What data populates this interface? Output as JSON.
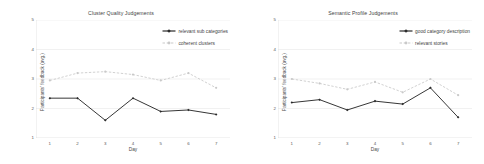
{
  "figure": {
    "background": "#ffffff",
    "solid_color": "#2b2b2b",
    "dashed_color": "#c9c9c9",
    "axis_color": "#d9d9d9",
    "grid_color": "#e8e8e8",
    "text_color": "#3f3f3f"
  },
  "panels": [
    {
      "id": "left",
      "chart_data": {
        "type": "line",
        "title": "Cluster Quality Judgements",
        "xlabel": "Day",
        "ylabel": "Participants' feedback (avg.)",
        "x": [
          1,
          2,
          3,
          4,
          5,
          6,
          7
        ],
        "xticklabels": [
          "1",
          "2",
          "3",
          "4",
          "5",
          "6",
          "7"
        ],
        "yticks": [
          1,
          2,
          3,
          4,
          5
        ],
        "yticklabels": [
          "1",
          "2",
          "3",
          "4",
          "5"
        ],
        "ylim": [
          1,
          5
        ],
        "xlim": [
          0.5,
          7.5
        ],
        "grid": "horizontal",
        "legend_position": "upper-right-inside",
        "series": [
          {
            "name": "relevant sub categories",
            "style": "solid",
            "marker": "diamond",
            "color": "#2b2b2b",
            "values": [
              2.35,
              2.35,
              1.6,
              2.35,
              1.9,
              1.95,
              1.8
            ]
          },
          {
            "name": "coherent clusters",
            "style": "dashed",
            "marker": "circle",
            "color": "#c9c9c9",
            "values": [
              2.95,
              3.2,
              3.25,
              3.15,
              2.95,
              3.2,
              2.7
            ]
          }
        ]
      }
    },
    {
      "id": "right",
      "chart_data": {
        "type": "line",
        "title": "Semantic Profile Judgements",
        "xlabel": "Day",
        "ylabel": "Participants' feedback (avg.)",
        "x": [
          1,
          2,
          3,
          4,
          5,
          6,
          7
        ],
        "xticklabels": [
          "1",
          "2",
          "3",
          "4",
          "5",
          "6",
          "7"
        ],
        "yticks": [
          1,
          2,
          3,
          4,
          5
        ],
        "yticklabels": [
          "1",
          "2",
          "3",
          "4",
          "5"
        ],
        "ylim": [
          1,
          5
        ],
        "xlim": [
          0.5,
          7.5
        ],
        "grid": "horizontal",
        "legend_position": "upper-right-inside",
        "series": [
          {
            "name": "good category description",
            "style": "solid",
            "marker": "diamond",
            "color": "#2b2b2b",
            "values": [
              2.2,
              2.3,
              1.95,
              2.25,
              2.15,
              2.7,
              1.7
            ]
          },
          {
            "name": "relevant stories",
            "style": "dashed",
            "marker": "circle",
            "color": "#c9c9c9",
            "values": [
              3.0,
              2.85,
              2.65,
              2.9,
              2.55,
              3.0,
              2.45
            ]
          }
        ]
      }
    }
  ]
}
